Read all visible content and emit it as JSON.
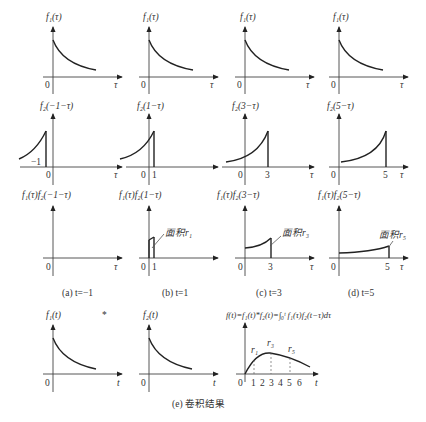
{
  "figure": {
    "row1": {
      "panels": [
        {
          "ylabel": "f₁(τ)",
          "xlabel": "τ",
          "origin": "0"
        },
        {
          "ylabel": "f₁(τ)",
          "xlabel": "τ",
          "origin": "0"
        },
        {
          "ylabel": "f₁(τ)",
          "xlabel": "τ",
          "origin": "0"
        },
        {
          "ylabel": "f₁(τ)",
          "xlabel": "τ",
          "origin": "0"
        }
      ]
    },
    "row2": {
      "panels": [
        {
          "ylabel": "f₂(−1−τ)",
          "xlabel": "τ",
          "origin": "0",
          "mark": "−1"
        },
        {
          "ylabel": "f₂(1−τ)",
          "xlabel": "τ",
          "origin": "0",
          "mark": "1"
        },
        {
          "ylabel": "f₂(3−τ)",
          "xlabel": "τ",
          "origin": "0",
          "mark": "3"
        },
        {
          "ylabel": "f₂(5−τ)",
          "xlabel": "τ",
          "origin": "0",
          "mark": "5"
        }
      ]
    },
    "row3": {
      "panels": [
        {
          "ylabel": "f₁(τ)f₂(−1−τ)",
          "xlabel": "τ",
          "origin": "0",
          "caption": "(a) t=−1"
        },
        {
          "ylabel": "f₁(τ)f₂(1−τ)",
          "xlabel": "τ",
          "origin": "0",
          "mark": "1",
          "area": "面积r₁",
          "caption": "(b) t=1"
        },
        {
          "ylabel": "f₁(τ)f₂(3−τ)",
          "xlabel": "τ",
          "origin": "0",
          "mark": "3",
          "area": "面积r₃",
          "caption": "(c) t=3"
        },
        {
          "ylabel": "f₁(τ)f₂(5−τ)",
          "xlabel": "τ",
          "origin": "0",
          "mark": "5",
          "area": "面积r₅",
          "caption": "(d) t=5"
        }
      ]
    },
    "row4": {
      "f1": {
        "ylabel": "f₁(t)",
        "xlabel": "t",
        "origin": "0"
      },
      "op": "*",
      "f2": {
        "ylabel": "f₂(t)",
        "xlabel": "t",
        "origin": "0"
      },
      "result": {
        "formula": "f(t)=f₁(t)*f₂(t)=∫₀ᵗ f₁(τ)f₂(t−τ)dτ",
        "xlabel": "t",
        "ticks": [
          "0",
          "1",
          "2",
          "3",
          "4",
          "5",
          "6"
        ],
        "points": [
          "r₁",
          "r₃",
          "r₅"
        ]
      },
      "caption": "(e) 卷积结果"
    }
  }
}
